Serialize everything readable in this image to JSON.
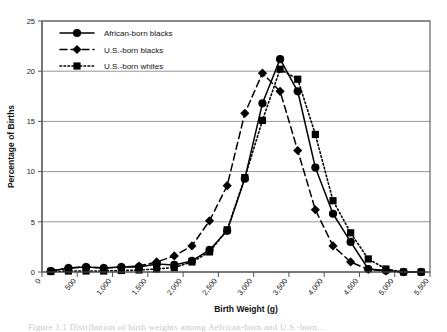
{
  "chart_data": {
    "type": "line",
    "title": "",
    "xlabel": "Birth Weight (g)",
    "ylabel": "Percentage of Births",
    "xlim": [
      0,
      5500
    ],
    "ylim": [
      0,
      25
    ],
    "yticks": [
      0,
      5,
      10,
      15,
      20,
      25
    ],
    "ytick_labels": [
      "0",
      "5",
      "10",
      "15",
      "20",
      "25"
    ],
    "xticks": [
      0,
      500,
      1000,
      1500,
      2000,
      2500,
      3000,
      3500,
      4000,
      4500,
      5000,
      5500
    ],
    "xtick_labels": [
      "0",
      "500",
      "1,000",
      "1,500",
      "2,000",
      "2,500",
      "3,000",
      "3,500",
      "4,000",
      "4,500",
      "5,000",
      "5,500"
    ],
    "grid": "horizontal",
    "legend_position": "top-left-inside",
    "x": [
      125,
      375,
      625,
      875,
      1125,
      1375,
      1625,
      1875,
      2125,
      2375,
      2625,
      2875,
      3125,
      3375,
      3625,
      3875,
      4125,
      4375,
      4625,
      4875,
      5125,
      5375
    ],
    "series": [
      {
        "name": "African-born blacks",
        "marker": "circle",
        "linestyle": "solid",
        "values": [
          0.1,
          0.4,
          0.5,
          0.4,
          0.5,
          0.5,
          0.8,
          0.7,
          1.1,
          2.2,
          4.1,
          9.3,
          16.8,
          21.2,
          18.0,
          10.4,
          5.8,
          3.0,
          0.3,
          0.15,
          0.0,
          0.0
        ]
      },
      {
        "name": "U.S.-born blacks",
        "marker": "diamond",
        "linestyle": "dashed",
        "values": [
          0.1,
          0.4,
          0.5,
          0.4,
          0.5,
          0.6,
          1.0,
          1.6,
          2.6,
          5.1,
          8.6,
          15.8,
          19.8,
          18.0,
          12.1,
          6.2,
          2.6,
          1.0,
          0.25,
          0.1,
          0.0,
          0.0
        ]
      },
      {
        "name": "U.S.-born whites",
        "marker": "square",
        "linestyle": "dotted",
        "values": [
          0.05,
          0.1,
          0.1,
          0.1,
          0.15,
          0.2,
          0.3,
          0.45,
          1.0,
          2.0,
          4.2,
          9.4,
          15.1,
          20.2,
          19.2,
          13.7,
          7.1,
          3.9,
          1.3,
          0.3,
          0.0,
          0.0
        ]
      }
    ]
  },
  "legend": {
    "items": [
      {
        "label": "African-born blacks"
      },
      {
        "label": "U.S.-born blacks"
      },
      {
        "label": "U.S.-born whites"
      }
    ]
  },
  "caption": {
    "text": "Figure 1.1  Distribution of birth weights among Aefrican-born and U.S.-born..."
  }
}
